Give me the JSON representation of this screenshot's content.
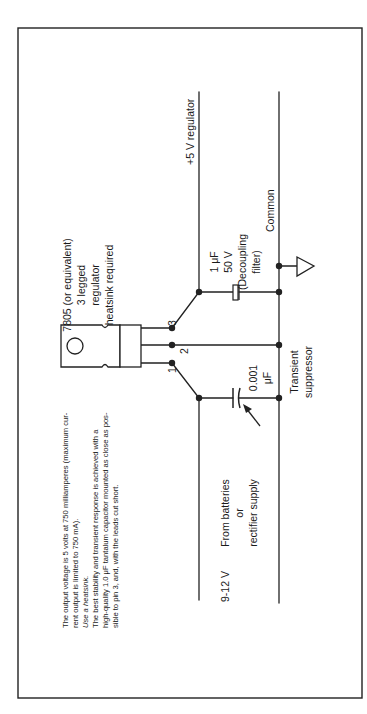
{
  "diagram": {
    "regulator": {
      "label_line1": "7805 (or equivalent)",
      "label_line2": "3 legged",
      "label_line3": "regulator",
      "label_line4": "heatsink required",
      "pins": [
        "1",
        "2",
        "3"
      ]
    },
    "output_label": "+5 V regulator",
    "common_label": "Common",
    "input": {
      "voltage": "9-12 V",
      "source_line1": "From batteries",
      "source_line2": "or",
      "source_line3": "rectifier supply"
    },
    "decoupling_cap": {
      "value": "1 μF",
      "voltage": "50 V",
      "desc_line1": "(Decoupling",
      "desc_line2": "filter)"
    },
    "suppressor_cap": {
      "value": "0.001",
      "unit": "μF",
      "label_line1": "Transient",
      "label_line2": "suppressor"
    },
    "notes": [
      "The output voltage is 5 volts at 750 milliamperes (maximum cur-",
      "rent output is limited to 750 mA).",
      "Use a heatsink.",
      "The best stability and transient response is achieved with a",
      "high-quality 1.0 μF tantalum capacitor mounted as close as pos-",
      "sible to pin 3, and, with the leads cut short."
    ]
  }
}
